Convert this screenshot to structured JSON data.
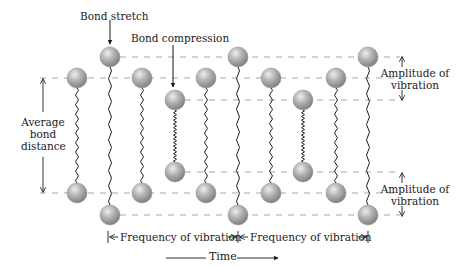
{
  "diagram": {
    "title_labels": {
      "bond_stretch": "Bond stretch",
      "bond_compression": "Bond compression",
      "average_bond_distance": [
        "Average",
        "bond",
        "distance"
      ],
      "amplitude_top": [
        "Amplitude of",
        "vibration"
      ],
      "amplitude_bottom": [
        "Amplitude of",
        "vibration"
      ],
      "frequency_1": "Frequency of vibration",
      "frequency_2": "Frequency of vibration",
      "time": "Time"
    },
    "colors": {
      "sphere": "#9a9a9a",
      "sphere_highlight": "#e6e6e6",
      "dashed_line": "#a8a8a8",
      "spring": "#1a1a1a",
      "text": "#1a1a1a"
    },
    "levels": {
      "stretch_top": 57,
      "average_top": 78,
      "compression_top": 100,
      "compression_bottom": 172,
      "average_bottom": 193,
      "stretch_bottom": 215
    },
    "molecules": [
      {
        "x": 77,
        "state": "average"
      },
      {
        "x": 110,
        "state": "stretch"
      },
      {
        "x": 142,
        "state": "average"
      },
      {
        "x": 175,
        "state": "compression"
      },
      {
        "x": 206,
        "state": "average"
      },
      {
        "x": 238,
        "state": "stretch"
      },
      {
        "x": 271,
        "state": "average"
      },
      {
        "x": 303,
        "state": "compression"
      },
      {
        "x": 336,
        "state": "average"
      },
      {
        "x": 368,
        "state": "stretch"
      }
    ]
  }
}
